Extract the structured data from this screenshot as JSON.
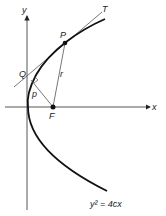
{
  "diagram": {
    "equation": "y² = 4cx",
    "axes": {
      "x_label": "x",
      "y_label": "y"
    },
    "points": {
      "P": {
        "label": "P",
        "x": 65,
        "y": 43
      },
      "F": {
        "label": "F",
        "x": 53,
        "y": 107
      },
      "Q": {
        "label": "Q",
        "x": 31,
        "y": 80
      }
    },
    "line_labels": {
      "tangent": "T",
      "focal_radius": "r",
      "perpendicular": "p"
    },
    "colors": {
      "stroke": "#222222",
      "background": "#ffffff"
    }
  }
}
